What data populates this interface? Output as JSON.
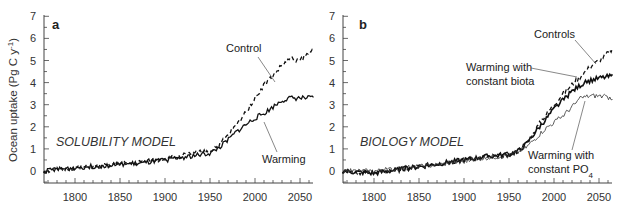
{
  "chart_data": [
    {
      "type": "line",
      "panel": "a",
      "title": "SOLUBILITY MODEL",
      "xlabel": "",
      "ylabel": "Ocean uptake (Pg C y⁻¹)",
      "xlim": [
        1765,
        2065
      ],
      "ylim": [
        -0.5,
        7
      ],
      "xticks": [
        1800,
        1850,
        1900,
        1950,
        2000,
        2050
      ],
      "yticks": [
        0,
        1,
        2,
        3,
        4,
        5,
        6,
        7
      ],
      "grid": false,
      "x": [
        1765,
        1800,
        1850,
        1875,
        1900,
        1925,
        1950,
        1960,
        1970,
        1980,
        1990,
        2000,
        2010,
        2020,
        2030,
        2040,
        2050,
        2065
      ],
      "series": [
        {
          "name": "Control",
          "style": "dashed",
          "values": [
            0.0,
            0.15,
            0.3,
            0.4,
            0.55,
            0.75,
            0.9,
            1.2,
            1.6,
            2.1,
            2.7,
            3.3,
            3.9,
            4.3,
            4.8,
            5.1,
            5.0,
            5.5
          ]
        },
        {
          "name": "Warming",
          "style": "solid",
          "values": [
            0.0,
            0.15,
            0.3,
            0.35,
            0.5,
            0.65,
            0.8,
            1.05,
            1.4,
            1.8,
            2.1,
            2.4,
            2.6,
            2.9,
            3.2,
            3.3,
            3.3,
            3.3
          ]
        }
      ],
      "annotations": [
        "Control",
        "Warming"
      ]
    },
    {
      "type": "line",
      "panel": "b",
      "title": "BIOLOGY MODEL",
      "xlabel": "",
      "ylabel": "Ocean uptake (Pg C y⁻¹)",
      "xlim": [
        1765,
        2065
      ],
      "ylim": [
        -0.5,
        7
      ],
      "xticks": [
        1800,
        1850,
        1900,
        1950,
        2000,
        2050
      ],
      "yticks": [
        0,
        1,
        2,
        3,
        4,
        5,
        6,
        7
      ],
      "grid": false,
      "x": [
        1765,
        1800,
        1850,
        1875,
        1900,
        1925,
        1950,
        1960,
        1970,
        1980,
        1990,
        2000,
        2010,
        2020,
        2030,
        2040,
        2050,
        2065
      ],
      "series": [
        {
          "name": "Controls",
          "style": "dashed",
          "values": [
            0.0,
            -0.1,
            0.2,
            0.35,
            0.5,
            0.65,
            0.75,
            0.9,
            1.3,
            1.9,
            2.5,
            3.0,
            3.5,
            3.9,
            4.3,
            4.7,
            5.0,
            5.5
          ]
        },
        {
          "name": "Warming with constant biota",
          "style": "solid-bold",
          "values": [
            0.0,
            -0.1,
            0.2,
            0.35,
            0.5,
            0.65,
            0.75,
            0.9,
            1.25,
            1.8,
            2.3,
            2.8,
            3.2,
            3.6,
            3.9,
            4.1,
            4.2,
            4.3
          ]
        },
        {
          "name": "Warming with constant PO4",
          "style": "thin",
          "values": [
            0.0,
            0.0,
            0.2,
            0.3,
            0.45,
            0.6,
            0.7,
            0.85,
            1.1,
            1.5,
            1.9,
            2.2,
            2.5,
            2.9,
            3.3,
            3.4,
            3.4,
            3.3
          ]
        }
      ],
      "annotations": [
        "Controls",
        "Warming with constant biota",
        "Warming with constant PO4"
      ]
    }
  ],
  "panels": {
    "a": {
      "letter": "a",
      "model": "SOLUBILITY MODEL",
      "annot_control": "Control",
      "annot_warming": "Warming"
    },
    "b": {
      "letter": "b",
      "model": "BIOLOGY MODEL",
      "annot_controls": "Controls",
      "annot_biota_1": "Warming with",
      "annot_biota_2": "constant biota",
      "annot_po4_1": "Warming with",
      "annot_po4_2": "constant PO",
      "annot_po4_sub": "4"
    }
  },
  "axis": {
    "ylabel_main": "Ocean uptake (Pg C y",
    "ylabel_sup": "-1",
    "ylabel_end": ")",
    "yticks": [
      "0",
      "1",
      "2",
      "3",
      "4",
      "5",
      "6",
      "7"
    ],
    "xticks": [
      "1800",
      "1850",
      "1900",
      "1950",
      "2000",
      "2050"
    ]
  }
}
